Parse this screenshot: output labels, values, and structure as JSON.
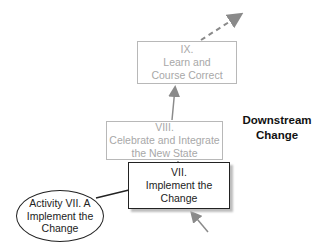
{
  "diagram": {
    "steps": [
      {
        "id": "ix",
        "numeral": "IX.",
        "title_lines": [
          "Learn and",
          "Course Correct"
        ],
        "state": "upcoming"
      },
      {
        "id": "viii",
        "numeral": "VIII.",
        "title_lines": [
          "Celebrate and Integrate",
          "the New State"
        ],
        "state": "upcoming"
      },
      {
        "id": "vii",
        "numeral": "VII.",
        "title_lines": [
          "Implement the",
          "Change"
        ],
        "state": "current"
      }
    ],
    "activity": {
      "lines": [
        "Activity VII. A",
        "Implement the",
        "Change"
      ]
    },
    "phase_label": {
      "lines": [
        "Downstream",
        "Change"
      ]
    },
    "colors": {
      "current": "#222222",
      "upcoming": "#a8a8a8",
      "arrow": "#8a8a8a"
    }
  }
}
